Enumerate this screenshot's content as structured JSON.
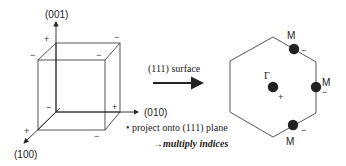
{
  "cube": {
    "axes": {
      "z": "(001)",
      "y": "(010)",
      "x": "(100)"
    },
    "signs": {
      "top_back_left": "+",
      "top_front_left": "−",
      "top_back_right": "−",
      "top_front_right": "−",
      "bottom_back_left": "−",
      "bottom_back_right": "+",
      "bottom_front_left": "+",
      "bottom_front_right": "−"
    }
  },
  "arrow": {
    "label": "(111) surface"
  },
  "notes": {
    "line1": "• project onto (111) plane",
    "line2": "→multiply indices"
  },
  "brillouin_zone": {
    "center_label": "Γ",
    "center_sign": "+",
    "points": [
      {
        "label": "M",
        "sign": "−"
      },
      {
        "label": "M",
        "sign": "−"
      },
      {
        "label": "M",
        "sign": "−"
      }
    ]
  }
}
